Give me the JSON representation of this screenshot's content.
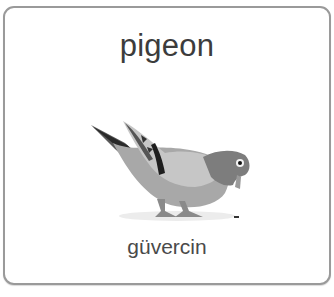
{
  "card": {
    "title": "pigeon",
    "translation": "güvercin",
    "image": {
      "icon": "pigeon-illustration",
      "subject": "pigeon"
    }
  },
  "colors": {
    "border": "#9a9a9a",
    "title_text": "#3c3c3c",
    "subtitle_text": "#4a4a4a",
    "bird_body": "#a6a6a6",
    "bird_head": "#7d7d7d",
    "bird_wing": "#c4c4c4",
    "wing_bar": "#1e1e1e"
  }
}
